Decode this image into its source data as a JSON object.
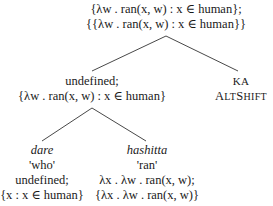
{
  "root": {
    "line1": "{λw . ran(x, w) : x ∈ human};",
    "line2": "{{λw . ran(x, w) : x ∈ human}}"
  },
  "mid_left": {
    "line1": "undefined;",
    "line2": "{λw . ran(x, w) : x ∈ human}"
  },
  "mid_right": {
    "line1": "KA",
    "line2": "ALTSHIFT"
  },
  "leaf_left": {
    "word": "dare",
    "gloss": "'who'",
    "line1": "undefined;",
    "line2": "{x : x ∈ human}"
  },
  "leaf_right": {
    "word": "hashitta",
    "gloss": "'ran'",
    "line1": "λx . λw . ran(x, w);",
    "line2": "{λx . λw . ran(x, w)}"
  }
}
